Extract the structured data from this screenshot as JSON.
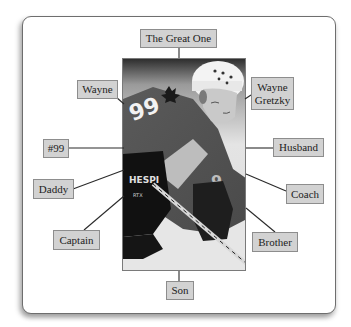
{
  "diagram": {
    "type": "labeled-photo-concept-map",
    "center": {
      "image_description": "Black-and-white photo of a hockey player wearing a white helmet and jersey number 99 with a maple leaf crest, holding a hockey stick",
      "jersey_number": "99",
      "glove_text": "HESPI",
      "glove_subtext": "RTX"
    },
    "labels": [
      {
        "id": "great-one",
        "text": "The Great One"
      },
      {
        "id": "wayne",
        "text": "Wayne"
      },
      {
        "id": "wayne-gretzky",
        "text": "Wayne Gretzky",
        "line1": "Wayne",
        "line2": "Gretzky"
      },
      {
        "id": "number-99",
        "text": "#99"
      },
      {
        "id": "husband",
        "text": "Husband"
      },
      {
        "id": "daddy",
        "text": "Daddy"
      },
      {
        "id": "coach",
        "text": "Coach"
      },
      {
        "id": "captain",
        "text": "Captain"
      },
      {
        "id": "brother",
        "text": "Brother"
      },
      {
        "id": "son",
        "text": "Son"
      }
    ]
  },
  "colors": {
    "label_fill": "#d2d2d2",
    "label_border": "#8d8d8d",
    "connector": "#2a2a2a",
    "panel_border": "#6e6e6e"
  }
}
